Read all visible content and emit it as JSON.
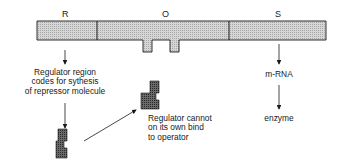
{
  "segments": [
    {
      "id": "R",
      "label": "R"
    },
    {
      "id": "O",
      "label": "O"
    },
    {
      "id": "S",
      "label": "S"
    }
  ],
  "annotations": {
    "regulator_region": [
      "Regulator region",
      "codes for sythesis",
      "of repressor molecule"
    ],
    "regulator_cannot": [
      "Regulator cannot",
      "on its own bind",
      "to operator"
    ],
    "mrna": "m-RNA",
    "enzyme": "enzyme"
  },
  "colors": {
    "bar_fill": "#c9c9c9",
    "repressor_fill": "#5a5a5a",
    "stroke": "#1a1a1a"
  }
}
